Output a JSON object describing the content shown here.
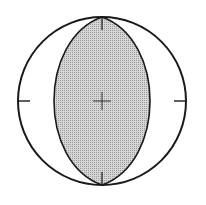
{
  "diagram": {
    "type": "focal-mechanism-beachball",
    "background": "#ffffff",
    "stroke_color": "#1a1a1a",
    "fill_color": "#c8c8c8",
    "circle": {
      "cx": 102,
      "cy": 101,
      "r": 84
    },
    "lens": {
      "half_width": 53
    },
    "ticks": [
      "north",
      "south",
      "east",
      "west"
    ],
    "center_marker": "cross"
  }
}
